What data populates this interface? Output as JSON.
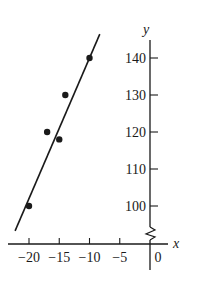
{
  "chart_data": {
    "type": "scatter",
    "title": "",
    "xlabel": "x",
    "ylabel": "y",
    "xlim": [
      -22,
      2
    ],
    "ylim": [
      94,
      145
    ],
    "y_axis_break": true,
    "x_ticks": [
      -20,
      -15,
      -10,
      -5,
      0
    ],
    "x_tick_labels": [
      "−20",
      "−15",
      "−10",
      "−5",
      "0"
    ],
    "y_ticks": [
      100,
      110,
      120,
      130,
      140
    ],
    "y_tick_labels": [
      "100",
      "110",
      "120",
      "130",
      "140"
    ],
    "points": [
      {
        "x": -20,
        "y": 100
      },
      {
        "x": -17,
        "y": 120
      },
      {
        "x": -15,
        "y": 118
      },
      {
        "x": -14,
        "y": 130
      },
      {
        "x": -10,
        "y": 140
      }
    ],
    "fit_line": {
      "slope": 3.8,
      "intercept": 178,
      "x_range": [
        -22.3,
        -8.3
      ]
    },
    "grid": false,
    "legend": "none"
  }
}
